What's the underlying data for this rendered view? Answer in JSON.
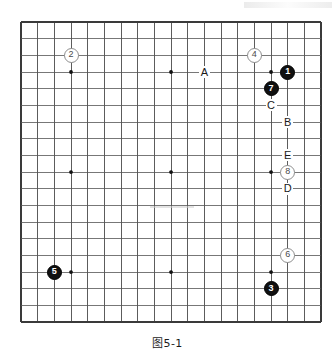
{
  "figure": {
    "caption": "图5-1",
    "board": {
      "size": 19,
      "origin_x": 21,
      "origin_y": 22,
      "spacing": 16.67,
      "line_color": "#555555",
      "border_color": "#3a3a3a",
      "star_color": "#111111",
      "star_points": [
        {
          "col": 3,
          "row": 3
        },
        {
          "col": 9,
          "row": 3
        },
        {
          "col": 15,
          "row": 3
        },
        {
          "col": 3,
          "row": 9
        },
        {
          "col": 9,
          "row": 9
        },
        {
          "col": 15,
          "row": 9
        },
        {
          "col": 3,
          "row": 15
        },
        {
          "col": 9,
          "row": 15
        },
        {
          "col": 15,
          "row": 15
        }
      ]
    },
    "stones": [
      {
        "label": "1",
        "color": "black",
        "col": 16,
        "row": 3
      },
      {
        "label": "2",
        "color": "white",
        "col": 3,
        "row": 2
      },
      {
        "label": "3",
        "color": "black",
        "col": 15,
        "row": 16
      },
      {
        "label": "4",
        "color": "white",
        "col": 14,
        "row": 2
      },
      {
        "label": "5",
        "color": "black",
        "col": 2,
        "row": 15
      },
      {
        "label": "6",
        "color": "white",
        "col": 16,
        "row": 14
      },
      {
        "label": "7",
        "color": "black",
        "col": 15,
        "row": 4
      },
      {
        "label": "8",
        "color": "white",
        "col": 16,
        "row": 9
      }
    ],
    "markers": [
      {
        "label": "A",
        "col": 11,
        "row": 3
      },
      {
        "label": "C",
        "col": 15,
        "row": 5
      },
      {
        "label": "B",
        "col": 16,
        "row": 6
      },
      {
        "label": "E",
        "col": 16,
        "row": 8
      },
      {
        "label": "D",
        "col": 16,
        "row": 10
      }
    ]
  }
}
